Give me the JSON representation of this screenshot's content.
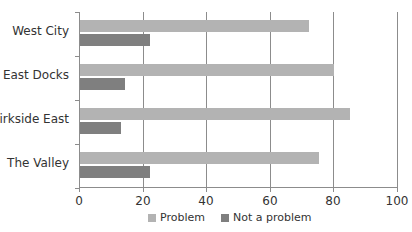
{
  "chart_data": {
    "type": "bar",
    "orientation": "horizontal",
    "title": "",
    "xlabel": "",
    "ylabel": "",
    "categories": [
      "West City",
      "East Docks",
      "Kirkside East",
      "The Valley"
    ],
    "series": [
      {
        "name": "Problem",
        "color": "#b3b3b3",
        "values": [
          72,
          80,
          85,
          75
        ]
      },
      {
        "name": "Not a problem",
        "color": "#7f7f7f",
        "values": [
          22,
          14,
          13,
          22
        ]
      }
    ],
    "xlim": [
      0,
      100
    ],
    "xticks": [
      "0",
      "20",
      "40",
      "60",
      "80",
      "100"
    ],
    "grid": "vertical",
    "legend_position": "bottom"
  },
  "legend": {
    "items": [
      {
        "label": "Problem",
        "color": "#b3b3b3"
      },
      {
        "label": "Not a problem",
        "color": "#7f7f7f"
      }
    ]
  }
}
